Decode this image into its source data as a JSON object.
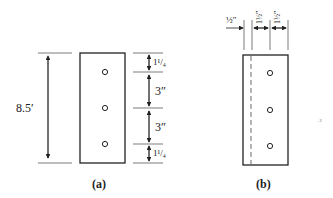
{
  "figure_a": {
    "caption": "(a)",
    "overall_height_label": "8.5′",
    "dims": [
      "1¹/₄",
      "3″",
      "3″",
      "1¹/₄"
    ],
    "holes": 3
  },
  "figure_b": {
    "caption": "(b)",
    "top_dims": [
      "½″",
      "1½″",
      "1½″"
    ],
    "holes": 3,
    "hidden_line": "dashed"
  }
}
